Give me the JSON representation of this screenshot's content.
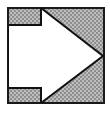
{
  "figure": {
    "name": "right-pointing-arrow-in-square",
    "canvas": {
      "width": 110,
      "height": 113,
      "background_color": "#ffffff"
    },
    "frame": {
      "name": "outer-square-frame",
      "x": 7,
      "y": 7,
      "width": 98,
      "height": 97,
      "stroke_color": "#1a1a1a",
      "stroke_width": 2,
      "fill_color": "#a9a9a9"
    },
    "texture": {
      "name": "dither-fill",
      "light_color": "#bdbdbd",
      "dark_color": "#8f8f8f",
      "cell_size": 2
    },
    "arrow": {
      "name": "white-arrow-polygon",
      "fill_color": "#ffffff",
      "stroke_color": "#111111",
      "stroke_width": 2,
      "direction": "right",
      "points": [
        [
          8,
          8
        ],
        [
          41,
          8
        ],
        [
          103,
          56
        ],
        [
          41,
          103
        ],
        [
          8,
          103
        ],
        [
          8,
          88
        ],
        [
          8,
          88
        ],
        [
          8,
          25
        ]
      ],
      "vertices": [
        {
          "label": "shaft-top-left",
          "x": 8,
          "y": 25
        },
        {
          "label": "notch-top-right",
          "x": 41,
          "y": 25
        },
        {
          "label": "head-top",
          "x": 41,
          "y": 8
        },
        {
          "label": "tip",
          "x": 103,
          "y": 56
        },
        {
          "label": "head-bottom",
          "x": 41,
          "y": 103
        },
        {
          "label": "notch-bottom-right",
          "x": 41,
          "y": 88
        },
        {
          "label": "shaft-bottom-left",
          "x": 8,
          "y": 88
        }
      ]
    }
  }
}
